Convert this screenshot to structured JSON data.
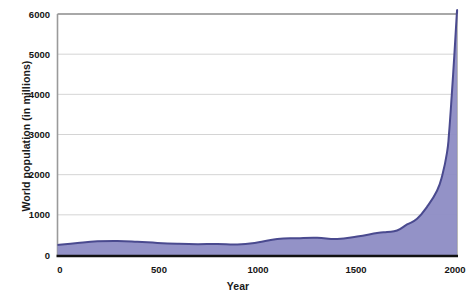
{
  "chart_data": {
    "type": "area",
    "title": "",
    "xlabel": "Year",
    "ylabel": "World population (in millions)",
    "xlim": [
      0,
      2000
    ],
    "ylim": [
      0,
      6000
    ],
    "xticks": [
      "0",
      "500",
      "1000",
      "1500",
      "2000"
    ],
    "yticks": [
      "0",
      "1000",
      "2000",
      "3000",
      "4000",
      "5000",
      "6000"
    ],
    "grid": "horizontal",
    "legend": "none",
    "series": [
      {
        "name": "World population",
        "x": [
          0,
          100,
          200,
          300,
          400,
          500,
          600,
          700,
          800,
          900,
          1000,
          1100,
          1200,
          1300,
          1400,
          1500,
          1600,
          1650,
          1700,
          1750,
          1800,
          1850,
          1900,
          1927,
          1950,
          1960,
          1974,
          1987,
          1999,
          2000
        ],
        "values": [
          250,
          300,
          340,
          350,
          330,
          300,
          280,
          270,
          275,
          260,
          310,
          400,
          420,
          430,
          400,
          460,
          545,
          575,
          610,
          760,
          900,
          1200,
          1600,
          2000,
          2550,
          3020,
          4000,
          5000,
          6000,
          6000
        ]
      }
    ],
    "colors": {
      "area_fill": "#8d8cc4",
      "area_line": "#4a4a8f",
      "axis": "#7a7a7a",
      "baseline": "#111111",
      "grid": "#c9c9c9",
      "text": "#151515",
      "background": "#ffffff"
    }
  },
  "axes": {
    "y_tick_values": [
      0,
      1000,
      2000,
      3000,
      4000,
      5000,
      6000
    ],
    "x_tick_values": [
      0,
      500,
      1000,
      1500,
      2000
    ]
  }
}
